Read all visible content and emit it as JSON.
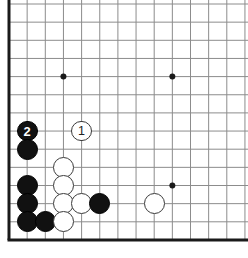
{
  "diagram": {
    "type": "go-board-diagram",
    "board": {
      "background_color": "#ffffff",
      "line_color": "#8c8c8c",
      "edge_color": "#1a1a1a",
      "origin_x": 9,
      "origin_y": 4,
      "spacing": 18.15,
      "cols": 14,
      "rows": 14,
      "left_edge_col": 0,
      "bottom_edge_row": 13,
      "edge_line_width": 3,
      "grid_line_width": 1
    },
    "star_points": [
      {
        "name": "star-point-upper-left",
        "col": 3,
        "row": 4
      },
      {
        "name": "star-point-upper-right",
        "col": 9,
        "row": 4
      },
      {
        "name": "star-point-lower-right",
        "col": 9,
        "row": 10
      }
    ],
    "stones": [
      {
        "name": "black-stone-move-2",
        "color": "black",
        "col": 1,
        "row": 7,
        "label": "2"
      },
      {
        "name": "white-stone-move-1",
        "color": "white",
        "col": 4,
        "row": 7,
        "label": "1"
      },
      {
        "name": "black-stone",
        "color": "black",
        "col": 1,
        "row": 8,
        "label": ""
      },
      {
        "name": "white-stone",
        "color": "white",
        "col": 3,
        "row": 9,
        "label": ""
      },
      {
        "name": "black-stone",
        "color": "black",
        "col": 1,
        "row": 10,
        "label": ""
      },
      {
        "name": "white-stone",
        "color": "white",
        "col": 3,
        "row": 10,
        "label": ""
      },
      {
        "name": "black-stone",
        "color": "black",
        "col": 1,
        "row": 11,
        "label": ""
      },
      {
        "name": "white-stone",
        "color": "white",
        "col": 3,
        "row": 11,
        "label": ""
      },
      {
        "name": "white-stone",
        "color": "white",
        "col": 4,
        "row": 11,
        "label": ""
      },
      {
        "name": "black-stone",
        "color": "black",
        "col": 5,
        "row": 11,
        "label": ""
      },
      {
        "name": "white-stone",
        "color": "white",
        "col": 8,
        "row": 11,
        "label": ""
      },
      {
        "name": "black-stone",
        "color": "black",
        "col": 1,
        "row": 12,
        "label": ""
      },
      {
        "name": "black-stone",
        "color": "black",
        "col": 2,
        "row": 12,
        "label": ""
      },
      {
        "name": "white-stone",
        "color": "white",
        "col": 3,
        "row": 12,
        "label": ""
      }
    ],
    "stone_radius": 10.4,
    "star_point_radius": 3,
    "move_labels": [
      "1",
      "2"
    ],
    "colors": {
      "black_stone": "#111111",
      "white_stone": "#ffffff",
      "white_stone_border": "#3a3a3a",
      "grid": "#8c8c8c",
      "board_edge": "#1a1a1a"
    }
  }
}
